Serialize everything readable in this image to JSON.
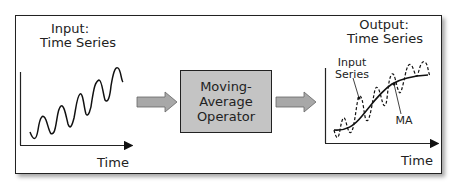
{
  "input_panel": {
    "title_line1": "Input:",
    "title_line2": "Time Series",
    "x_axis_label": "Time"
  },
  "operator": {
    "line1": "Moving-",
    "line2": "Average",
    "line3": "Operator"
  },
  "output_panel": {
    "title_line1": "Output:",
    "title_line2": "Time Series",
    "x_axis_label": "Time",
    "annotation_input_line1": "Input",
    "annotation_input_line2": "Series",
    "annotation_ma": "MA"
  },
  "colors": {
    "frame": "#222222",
    "operator_fill": "#c4c4c4",
    "arrow_fill": "#a8a8a8"
  }
}
